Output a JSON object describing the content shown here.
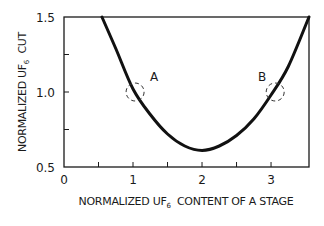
{
  "chart_data": {
    "type": "line",
    "title": "",
    "xlabel": "NORMALIZED UF6 CONTENT OF A STAGE",
    "ylabel": "NORMALIZED UF6 CUT",
    "xlabel_parts": {
      "pre": "NORMALIZED UF",
      "sub": "6",
      "post": "  CONTENT OF A STAGE"
    },
    "ylabel_parts": {
      "pre": "NORMALIZED UF",
      "sub": "6",
      "post": "  CUT"
    },
    "xlim": [
      0,
      3.55
    ],
    "ylim": [
      0.5,
      1.5
    ],
    "x_ticks": [
      0,
      1,
      2,
      3
    ],
    "x_tick_labels": [
      "0",
      "1",
      "2",
      "3"
    ],
    "x_minor_ticks": [
      0.5,
      1.5,
      2.5
    ],
    "y_ticks": [
      0.5,
      1.0,
      1.5
    ],
    "y_tick_labels": [
      "0.5",
      "1.0",
      "1.5"
    ],
    "y_minor_ticks": [
      0.75,
      1.25
    ],
    "grid": false,
    "legend": null,
    "series": [
      {
        "name": "UF6 cut vs content",
        "x": [
          0.55,
          0.75,
          1.0,
          1.25,
          1.5,
          1.75,
          2.0,
          2.25,
          2.5,
          2.75,
          3.0,
          3.25,
          3.55
        ],
        "y": [
          1.5,
          1.29,
          1.02,
          0.85,
          0.72,
          0.64,
          0.61,
          0.64,
          0.71,
          0.82,
          0.98,
          1.17,
          1.5
        ]
      }
    ],
    "annotations": [
      {
        "label": "A",
        "x": 1.03,
        "y": 1.0,
        "marker": "dashed-circle"
      },
      {
        "label": "B",
        "x": 3.06,
        "y": 1.0,
        "marker": "dashed-circle"
      }
    ],
    "minimum": {
      "x": 2.0,
      "y": 0.61
    }
  }
}
